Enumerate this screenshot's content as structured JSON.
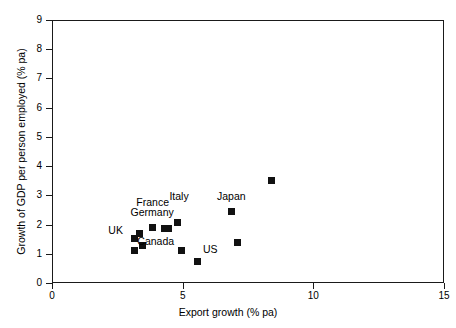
{
  "chart_data": {
    "type": "scatter",
    "title": "",
    "xlabel": "Export growth (% pa)",
    "ylabel": "Growth of GDP per person employed (% pa)",
    "xlim": [
      0,
      15
    ],
    "ylim": [
      0,
      9
    ],
    "xticks": [
      0,
      5,
      10,
      15
    ],
    "yticks": [
      0,
      1,
      2,
      3,
      4,
      5,
      6,
      7,
      8,
      9
    ],
    "xtick_labels": [
      "0",
      "5",
      "10",
      "15"
    ],
    "ytick_labels": [
      "0",
      "1",
      "2",
      "3",
      "4",
      "5",
      "6",
      "7",
      "8",
      "9"
    ],
    "grid": false,
    "legend": "none",
    "marker_color": "#111111",
    "marker_shape": "square",
    "points": [
      {
        "name": "UK",
        "x": 3.15,
        "y": 1.53,
        "label": "UK",
        "label_dx": -26,
        "label_dy": -13
      },
      {
        "name": "point-2",
        "x": 3.35,
        "y": 1.68,
        "label": "",
        "label_dx": 0,
        "label_dy": 0
      },
      {
        "name": "point-3",
        "x": 3.15,
        "y": 1.12,
        "label": "",
        "label_dx": 0,
        "label_dy": 0
      },
      {
        "name": "point-4",
        "x": 3.45,
        "y": 1.27,
        "label": "",
        "label_dx": 0,
        "label_dy": 0
      },
      {
        "name": "Germany",
        "x": 3.85,
        "y": 1.9,
        "label": "Germany",
        "label_dx": -22,
        "label_dy": -20
      },
      {
        "name": "France",
        "x": 4.3,
        "y": 1.88,
        "label": "France",
        "label_dx": -28,
        "label_dy": -31
      },
      {
        "name": "point-7",
        "x": 4.45,
        "y": 1.88,
        "label": "",
        "label_dx": 0,
        "label_dy": 0
      },
      {
        "name": "Italy",
        "x": 4.8,
        "y": 2.08,
        "label": "Italy",
        "label_dx": -8,
        "label_dy": -31
      },
      {
        "name": "Canada",
        "x": 4.95,
        "y": 1.1,
        "label": "Canada",
        "label_dx": -44,
        "label_dy": -15
      },
      {
        "name": "US",
        "x": 5.55,
        "y": 0.72,
        "label": "US",
        "label_dx": 6,
        "label_dy": -18
      },
      {
        "name": "Japan",
        "x": 6.85,
        "y": 2.45,
        "label": "Japan",
        "label_dx": -14,
        "label_dy": -20
      },
      {
        "name": "point-12",
        "x": 7.1,
        "y": 1.38,
        "label": "",
        "label_dx": 0,
        "label_dy": 0
      },
      {
        "name": "point-13",
        "x": 8.4,
        "y": 3.52,
        "label": "",
        "label_dx": 0,
        "label_dy": 0
      }
    ]
  }
}
